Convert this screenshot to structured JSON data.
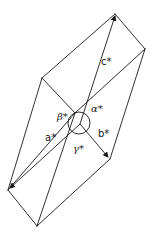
{
  "figure": {
    "labels": {
      "c_star": "c*",
      "a_star": "a*",
      "b_star": "b*",
      "alpha_star": "α*",
      "beta_star": "β*",
      "gamma_star": "γ*"
    },
    "colors": {
      "line": "#1a1a1a",
      "background": "#ffffff"
    }
  }
}
